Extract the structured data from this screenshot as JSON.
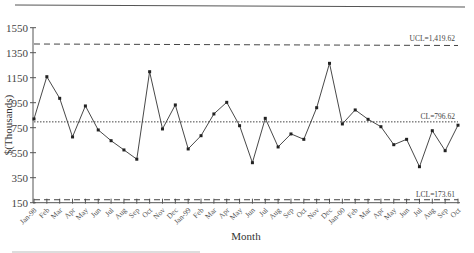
{
  "chart_data": {
    "type": "line",
    "title": "",
    "xlabel": "Month",
    "ylabel": "$(Thousands)",
    "ylim": [
      150,
      1550
    ],
    "yticks": [
      150,
      350,
      550,
      750,
      950,
      1150,
      1350,
      1550
    ],
    "grid": false,
    "categories": [
      "Jan-98",
      "Feb",
      "Mar",
      "Apr",
      "May",
      "Jun",
      "Jul",
      "Aug",
      "Sep",
      "Oct",
      "Nov",
      "Dec",
      "Jan-99",
      "Feb",
      "Mar",
      "Apr",
      "May",
      "Jun",
      "Jul",
      "Aug",
      "Sep",
      "Oct",
      "Nov",
      "Dec",
      "Jan-00",
      "Feb",
      "Mar",
      "Apr",
      "May",
      "Jun",
      "Jul",
      "Aug",
      "Sep",
      "Oct"
    ],
    "series": [
      {
        "name": "Monthly value",
        "values": [
          820,
          1158,
          985,
          676,
          924,
          732,
          646,
          572,
          498,
          1198,
          740,
          932,
          580,
          686,
          860,
          953,
          766,
          470,
          825,
          596,
          700,
          657,
          910,
          1265,
          780,
          892,
          817,
          758,
          614,
          657,
          438,
          726,
          566,
          770
        ]
      }
    ],
    "control_limits": [
      {
        "name": "UCL",
        "label": "UCL=1,419.62",
        "value": 1419.62,
        "style": "dashed"
      },
      {
        "name": "CL",
        "label": "CL=796.62",
        "value": 796.62,
        "style": "dotted"
      },
      {
        "name": "LCL",
        "label": "LCL=173.61",
        "value": 173.61,
        "style": "dashed"
      }
    ]
  },
  "labels": {
    "xlabel": "Month",
    "ylabel": "$(Thousands)",
    "ucl": "UCL=1,419.62",
    "cl": "CL=796.62",
    "lcl": "LCL=173.61"
  }
}
